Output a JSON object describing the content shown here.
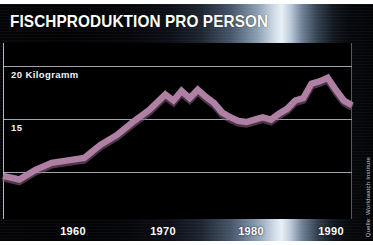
{
  "title": "FISCHPRODUKTION PRO PERSON",
  "source_note": "Quelle: Worldwatch Institute",
  "colors": {
    "line": "#b07fa4",
    "line_shadow": "#8e6485",
    "background": "#000000",
    "grid": "#c9ced6",
    "text": "#ffffff"
  },
  "axis": {
    "y_labels": [
      {
        "text": "20 Kilogramm",
        "value": 20
      },
      {
        "text": "15",
        "value": 15
      }
    ],
    "x_labels": [
      {
        "text": "1960",
        "value": 1960
      },
      {
        "text": "1970",
        "value": 1970
      },
      {
        "text": "1980",
        "value": 1980
      },
      {
        "text": "1990",
        "value": 1990
      }
    ]
  },
  "chart_data": {
    "type": "line",
    "title": "FISCHPRODUKTION PRO PERSON",
    "subtitle": "",
    "xlabel": "",
    "ylabel": "Kilogramm",
    "xlim": [
      1950,
      1993
    ],
    "ylim": [
      6.5,
      21.2
    ],
    "grid": true,
    "gridlines_y": [
      20,
      15,
      10
    ],
    "legend": "none",
    "annotations": [
      "Quelle: Worldwatch Institute"
    ],
    "x": [
      1950,
      1952,
      1954,
      1956,
      1958,
      1960,
      1962,
      1964,
      1966,
      1968,
      1970,
      1971,
      1972,
      1973,
      1974,
      1975,
      1976,
      1977,
      1978,
      1979,
      1980,
      1981,
      1982,
      1983,
      1984,
      1985,
      1986,
      1987,
      1988,
      1989,
      1990,
      1991,
      1992,
      1993
    ],
    "values": [
      10.1,
      9.8,
      10.6,
      11.2,
      11.4,
      11.6,
      12.7,
      13.5,
      14.6,
      15.6,
      16.9,
      16.4,
      17.2,
      16.6,
      17.3,
      16.7,
      16.2,
      15.4,
      15.0,
      14.7,
      14.6,
      14.8,
      15.0,
      14.8,
      15.3,
      15.7,
      16.4,
      16.6,
      17.8,
      18.0,
      18.3,
      17.3,
      16.4,
      16.0
    ],
    "series": [
      {
        "name": "Fischproduktion pro Person",
        "unit": "Kilogramm",
        "values": [
          10.1,
          9.8,
          10.6,
          11.2,
          11.4,
          11.6,
          12.7,
          13.5,
          14.6,
          15.6,
          16.9,
          16.4,
          17.2,
          16.6,
          17.3,
          16.7,
          16.2,
          15.4,
          15.0,
          14.7,
          14.6,
          14.8,
          15.0,
          14.8,
          15.3,
          15.7,
          16.4,
          16.6,
          17.8,
          18.0,
          18.3,
          17.3,
          16.4,
          16.0
        ]
      }
    ]
  }
}
